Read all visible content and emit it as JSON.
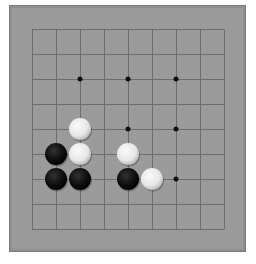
{
  "board": {
    "size": 9,
    "background": "#9b9b9b",
    "line_color": "#6e6e6e",
    "origin_x": 32,
    "origin_y": 29,
    "spacing_x": 24,
    "spacing_y": 25,
    "stone_radius": 11,
    "star_points": [
      [
        2,
        2
      ],
      [
        4,
        2
      ],
      [
        6,
        2
      ],
      [
        4,
        4
      ],
      [
        6,
        4
      ],
      [
        6,
        6
      ]
    ],
    "stones": [
      {
        "col": 2,
        "row": 4,
        "color": "white"
      },
      {
        "col": 1,
        "row": 5,
        "color": "black"
      },
      {
        "col": 2,
        "row": 5,
        "color": "white"
      },
      {
        "col": 4,
        "row": 5,
        "color": "white"
      },
      {
        "col": 1,
        "row": 6,
        "color": "black"
      },
      {
        "col": 2,
        "row": 6,
        "color": "black"
      },
      {
        "col": 4,
        "row": 6,
        "color": "black"
      },
      {
        "col": 5,
        "row": 6,
        "color": "white"
      }
    ]
  },
  "colors": {
    "black_stone": "#111111",
    "white_stone": "#e6e6e6",
    "star_point": "#111111"
  }
}
